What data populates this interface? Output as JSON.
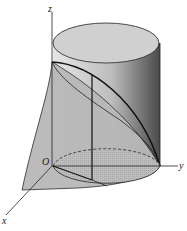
{
  "figure": {
    "type": "3d-solid-cylinder-wedge",
    "axes": {
      "x": "x",
      "y": "y",
      "z": "z",
      "origin": "O"
    },
    "caption": "图 ···"
  }
}
